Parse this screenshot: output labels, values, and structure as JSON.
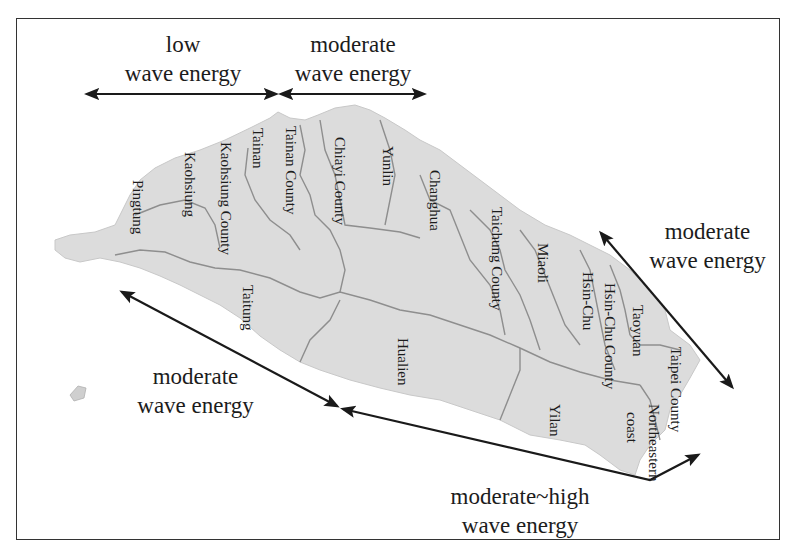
{
  "figure": {
    "type": "map",
    "region": "Taiwan (rotated view, west coast on top)",
    "colors": {
      "land": "#dcdcdc",
      "boundary": "#8e8e8e",
      "arrow": "#1a1a1a",
      "frame": "#333333"
    }
  },
  "zones": [
    {
      "id": "top-left",
      "line1": "low",
      "line2": "wave energy"
    },
    {
      "id": "top-right",
      "line1": "moderate",
      "line2": "wave energy"
    },
    {
      "id": "right",
      "line1": "moderate",
      "line2": "wave energy"
    },
    {
      "id": "bottom-left",
      "line1": "moderate",
      "line2": "wave energy"
    },
    {
      "id": "bottom",
      "line1": "moderate~high",
      "line2": "wave energy"
    }
  ],
  "regions": [
    {
      "name": "Pingtung"
    },
    {
      "name": "Kaohsiung"
    },
    {
      "name": "Kaohsiung County"
    },
    {
      "name": "Tainan"
    },
    {
      "name": "Tainan County"
    },
    {
      "name": "Chiayi County"
    },
    {
      "name": "Yunlin"
    },
    {
      "name": "Changhua"
    },
    {
      "name": "Taichung County"
    },
    {
      "name": "Miaoli"
    },
    {
      "name": "Hsin-Chu"
    },
    {
      "name": "Hsin-Chu County"
    },
    {
      "name": "Taoyuan"
    },
    {
      "name": "Taipei County"
    },
    {
      "name": "Northeastern"
    },
    {
      "name": "coast"
    },
    {
      "name": "Yilan"
    },
    {
      "name": "Hualien"
    },
    {
      "name": "Taitung"
    }
  ]
}
